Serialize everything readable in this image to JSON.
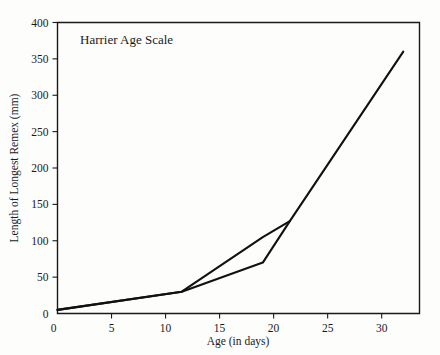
{
  "chart_data": {
    "type": "line",
    "title": "Harrier Age Scale",
    "xlabel": "Age (in days)",
    "ylabel": "Length of Longest Remex (mm)",
    "xlim": [
      0,
      33.5
    ],
    "ylim": [
      0,
      400
    ],
    "grid": false,
    "legend": "none",
    "xticks": [
      0,
      5,
      10,
      15,
      20,
      25,
      30
    ],
    "xtick_labels": [
      "0",
      "5",
      "10",
      "15",
      "20",
      "25",
      "30"
    ],
    "yticks": [
      0,
      50,
      100,
      150,
      200,
      250,
      300,
      350,
      400
    ],
    "ytick_labels": [
      "0",
      "50",
      "100",
      "150",
      "200",
      "250",
      "300",
      "350",
      "400"
    ],
    "series": [
      {
        "name": "upper-bound",
        "x": [
          0,
          11.5,
          19,
          21.5,
          32
        ],
        "values": [
          5,
          30,
          105,
          127,
          360
        ]
      },
      {
        "name": "lower-bound",
        "x": [
          0,
          11.5,
          19,
          21.5
        ],
        "values": [
          5,
          30,
          70,
          127
        ]
      }
    ],
    "colors": {
      "line": "#111111",
      "axis": "#1a1a1a",
      "background": "#fdfdfc"
    }
  }
}
